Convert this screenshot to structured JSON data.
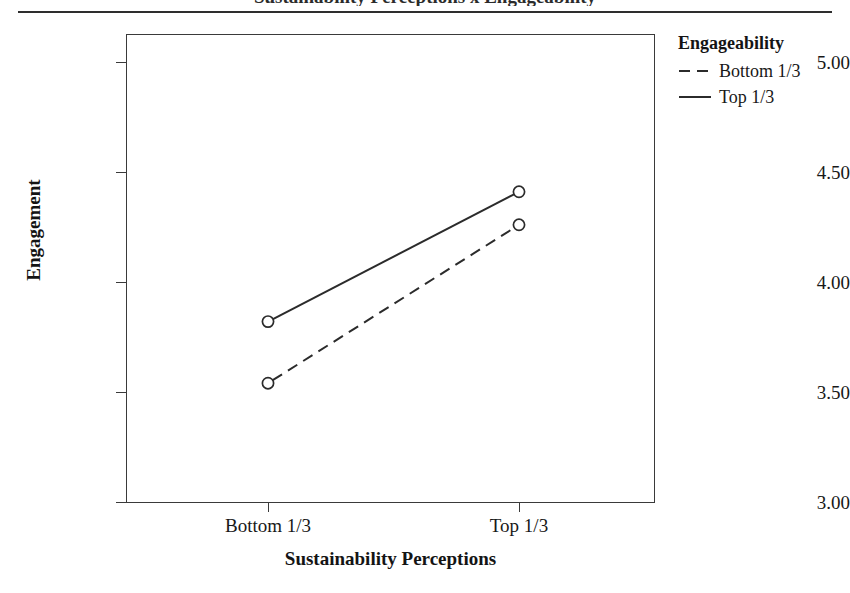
{
  "figure": {
    "title_remnant": "Sustainability Perceptions x Engageability",
    "has_top_rule": true
  },
  "chart_data": {
    "type": "line",
    "title": "",
    "xlabel": "Sustainability Perceptions",
    "ylabel": "Engagement",
    "categories": [
      "Bottom 1/3",
      "Top 1/3"
    ],
    "xtick_labels": [
      "Bottom 1/3",
      "Top 1/3"
    ],
    "ytick_labels": [
      "5.00",
      "4.50",
      "4.00",
      "3.50",
      "3.00"
    ],
    "ytick_values": [
      5.0,
      4.5,
      4.0,
      3.5,
      3.0
    ],
    "ylim": [
      2.9,
      5.0
    ],
    "grid": false,
    "legend_position": "right",
    "legend_title": "Engageability",
    "marker": "open-circle",
    "series": [
      {
        "name": "Bottom 1/3",
        "linestyle": "dashed",
        "color": "#2b2b2b",
        "values": [
          3.54,
          4.26
        ]
      },
      {
        "name": "Top 1/3",
        "linestyle": "solid",
        "color": "#2b2b2b",
        "values": [
          3.82,
          4.41
        ]
      }
    ]
  }
}
